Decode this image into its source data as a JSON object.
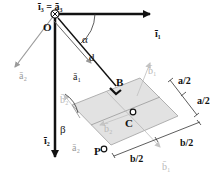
{
  "diagram": {
    "type": "mechanics-free-body",
    "colors": {
      "axis": "#111111",
      "plate_fill": "#e2e2e2",
      "plate_edge": "#b0b0b0",
      "body_axis": "#9a9a9a",
      "faint_axis": "#c4c4c4"
    },
    "labels": {
      "i3_eq_a3": "ī₃ = ā₃",
      "i1": "ī₁",
      "i2": "ī₂",
      "O": "O",
      "alpha": "α",
      "d": "d",
      "a1": "ā₁",
      "a2_left": "ā₂",
      "a2_bottom": "ā₂",
      "B": "B",
      "C": "C",
      "P": "P",
      "b1_top": "b̄₁",
      "b1_bottom": "b̄₁",
      "b2_left": "b̄₂",
      "b2_center": "b̄₂",
      "beta": "β",
      "a_half_1": "a/2",
      "a_half_2": "a/2",
      "b_half_1": "b/2",
      "b_half_2": "b/2"
    }
  }
}
